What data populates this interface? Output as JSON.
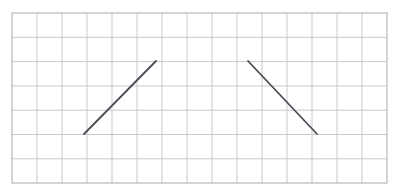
{
  "figure": {
    "canvas": {
      "width": 402,
      "height": 196,
      "background": "#ffffff"
    },
    "grid": {
      "name": "square-grid",
      "origin_x": 12,
      "origin_y": 13,
      "cell_width": 25,
      "cell_height": 24.3,
      "columns": 15,
      "rows": 7,
      "right_edge": 387,
      "bottom_edge": 183,
      "line_color": "#c9c9cd",
      "line_width": 1,
      "border_color": "#a9a9ad",
      "border_width": 1
    },
    "segments": [
      {
        "name": "left-rising-segment",
        "label": "rising diagonal",
        "direction": "up-right",
        "x1": 84,
        "y1": 134,
        "x2": 156,
        "y2": 61,
        "grid_start_col": 3,
        "grid_start_row": 5,
        "grid_end_col": 6,
        "grid_end_row": 2,
        "color": "#4c4c55",
        "stroke_width": 1.8,
        "slope_cells": "3 right, 3 up"
      },
      {
        "name": "right-falling-segment",
        "label": "falling diagonal",
        "direction": "down-right",
        "x1": 248,
        "y1": 61,
        "x2": 317,
        "y2": 134,
        "grid_start_col": 9,
        "grid_start_row": 2,
        "grid_end_col": 12,
        "grid_end_row": 5,
        "color": "#4c4c55",
        "stroke_width": 1.8,
        "slope_cells": "3 right, 3 down"
      }
    ]
  },
  "chart_data": {
    "type": "line",
    "title": "",
    "xlabel": "",
    "ylabel": "",
    "grid": true,
    "xlim": [
      0,
      15
    ],
    "ylim": [
      0,
      7
    ],
    "series": [
      {
        "name": "rising diagonal",
        "x": [
          3,
          6
        ],
        "y": [
          2,
          5
        ]
      },
      {
        "name": "falling diagonal",
        "x": [
          9,
          12
        ],
        "y": [
          5,
          2
        ]
      }
    ]
  }
}
